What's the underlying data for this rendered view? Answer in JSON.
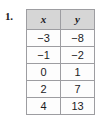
{
  "exercise": {
    "number_label": "1."
  },
  "table": {
    "headers": [
      "x",
      "y"
    ],
    "rows": [
      [
        "−3",
        "−8"
      ],
      [
        "−1",
        "−2"
      ],
      [
        "0",
        "1"
      ],
      [
        "2",
        "7"
      ],
      [
        "4",
        "13"
      ]
    ]
  },
  "colors": {
    "page_background": "#ffffff",
    "header_fill": "#d6d6d6",
    "cell_fill": "#fdfdfd",
    "border": "#9d9da1",
    "text": "#1b1b1e"
  }
}
